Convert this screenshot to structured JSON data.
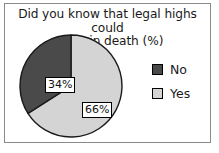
{
  "chart_data": {
    "type": "pie",
    "title": "Did you know that legal highs could result in death (%)",
    "title_line1": "Did you know that legal highs could",
    "title_line2": "result in death (%)",
    "xlabel": "",
    "ylabel": "",
    "grid": false,
    "legend_position": "right",
    "start_angle_deg": 0,
    "direction": "clockwise",
    "categories": [
      "Yes",
      "No"
    ],
    "values": [
      66,
      34
    ],
    "slices": [
      {
        "label": "Yes",
        "value": 66,
        "data_label": "66%",
        "color": "#d4d4d4",
        "edge_color": "#1a1a1a"
      },
      {
        "label": "No",
        "value": 34,
        "data_label": "34%",
        "color": "#4a4a4a",
        "edge_color": "#1a1a1a"
      }
    ],
    "legend": [
      {
        "label": "No",
        "color": "#4a4a4a"
      },
      {
        "label": "Yes",
        "color": "#d4d4d4"
      }
    ]
  },
  "frame": {
    "border_color": "#8a8a8a",
    "background": "#ffffff"
  }
}
